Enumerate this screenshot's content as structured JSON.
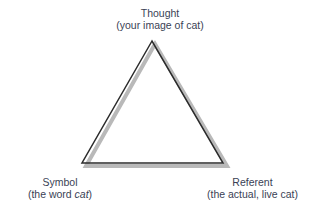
{
  "diagram": {
    "type": "semiotic-triangle",
    "nodes": {
      "thought": {
        "title": "Thought",
        "subtitle": "(your image of cat)"
      },
      "symbol": {
        "title": "Symbol",
        "subtitle_prefix": "(the word ",
        "subtitle_italic": "cat",
        "subtitle_suffix": ")"
      },
      "referent": {
        "title": "Referent",
        "subtitle": "(the actual, live cat)"
      }
    },
    "colors": {
      "line": "#2b2b2b",
      "shadow": "#b8b8b8",
      "text": "#3a3f55"
    }
  }
}
